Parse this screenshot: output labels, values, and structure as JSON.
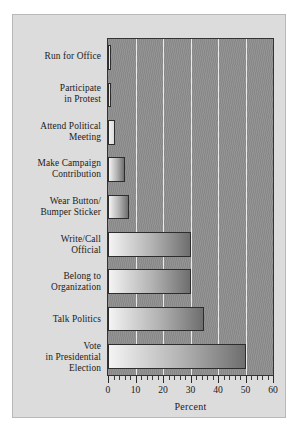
{
  "chart_data": {
    "type": "bar",
    "orientation": "horizontal",
    "title": "",
    "xlabel": "Percent",
    "ylabel": "",
    "xlim": [
      0,
      60
    ],
    "xticks": [
      0,
      10,
      20,
      30,
      40,
      50,
      60
    ],
    "xticklabels": [
      "0",
      "10",
      "20",
      "30",
      "40",
      "50",
      "60"
    ],
    "minor_tick_interval": 2,
    "grid": "vertical",
    "legend": "none",
    "categories": [
      "Run for Office",
      "Participate\nin Protest",
      "Attend Political\nMeeting",
      "Make Campaign\nContribution",
      "Wear Button/\nBumper Sticker",
      "Write/Call\nOfficial",
      "Belong to\nOrganization",
      "Talk Politics",
      "Vote\nin Presidential\nElection"
    ],
    "values": [
      1,
      1,
      2.5,
      6,
      7.5,
      30,
      30,
      35,
      50
    ],
    "colors": {
      "page_background": "#ffffff",
      "figure_background": "#dcdcdc",
      "plot_background": "#8e8e8e",
      "gridline": "#f2f2f2",
      "bar_light": "#f4f4f4",
      "bar_dark": "#6e6e6e",
      "bar_border": "#2d2d2d",
      "text": "#1b1b1b"
    }
  }
}
